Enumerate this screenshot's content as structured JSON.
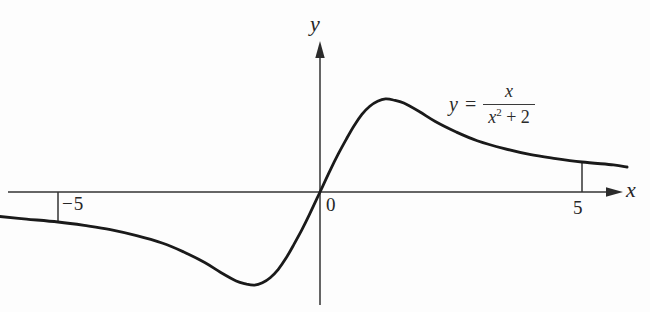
{
  "figure": {
    "background": "#fdfdfd",
    "curve_color": "#1a1a1a",
    "axis_color": "#333333"
  },
  "axes": {
    "x_label": "x",
    "y_label": "y",
    "origin_label": "0",
    "x_ticks": [
      {
        "value": -5,
        "label": "−5"
      },
      {
        "value": 5,
        "label": "5"
      }
    ]
  },
  "equation": {
    "lhs": "y",
    "equals": "=",
    "numerator": "x",
    "den_base": "x",
    "den_exponent": "2",
    "den_rest": " + 2"
  },
  "chart_data": {
    "type": "line",
    "title": "",
    "expression": "y = x / (x^2 + 2)",
    "xlabel": "x",
    "ylabel": "y",
    "grid": false,
    "legend": false,
    "x_range": [
      -6.1,
      5.9
    ],
    "y_range": [
      -0.36,
      0.36
    ],
    "x_tick_values": [
      -5,
      0,
      5
    ],
    "key_points": {
      "maximum": [
        1.4,
        0.35
      ],
      "minimum": [
        -1.4,
        -0.35
      ],
      "origin": [
        0,
        0
      ]
    },
    "points": [
      [
        -6.11,
        -0.093
      ],
      [
        -5.6,
        -0.103
      ],
      [
        -5,
        -0.114
      ],
      [
        -4.5,
        -0.127
      ],
      [
        -4,
        -0.143
      ],
      [
        -3.5,
        -0.166
      ],
      [
        -3,
        -0.195
      ],
      [
        -2.6,
        -0.228
      ],
      [
        -2.2,
        -0.268
      ],
      [
        -1.9,
        -0.305
      ],
      [
        -1.6,
        -0.338
      ],
      [
        -1.4,
        -0.35
      ],
      [
        -1.25,
        -0.354
      ],
      [
        -1.1,
        -0.345
      ],
      [
        -0.95,
        -0.326
      ],
      [
        -0.8,
        -0.295
      ],
      [
        -0.65,
        -0.252
      ],
      [
        -0.5,
        -0.2
      ],
      [
        -0.35,
        -0.145
      ],
      [
        -0.2,
        -0.085
      ],
      [
        0,
        0
      ],
      [
        0.2,
        0.085
      ],
      [
        0.35,
        0.145
      ],
      [
        0.5,
        0.2
      ],
      [
        0.65,
        0.252
      ],
      [
        0.8,
        0.295
      ],
      [
        0.95,
        0.326
      ],
      [
        1.1,
        0.345
      ],
      [
        1.25,
        0.354
      ],
      [
        1.4,
        0.35
      ],
      [
        1.6,
        0.338
      ],
      [
        1.9,
        0.305
      ],
      [
        2.2,
        0.268
      ],
      [
        2.6,
        0.228
      ],
      [
        3,
        0.195
      ],
      [
        3.5,
        0.166
      ],
      [
        4,
        0.143
      ],
      [
        4.5,
        0.127
      ],
      [
        5,
        0.114
      ],
      [
        5.6,
        0.103
      ],
      [
        5.86,
        0.095
      ]
    ]
  }
}
